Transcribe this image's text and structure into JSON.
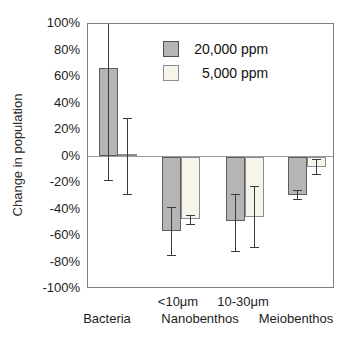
{
  "figure": {
    "background_color": "#ffffff",
    "frame_color": "#7f7f7f",
    "zero_line_color": "#9b9b9b",
    "error_bar_color": "#3a3a3a"
  },
  "legend": {
    "items": [
      {
        "label": "20,000 ppm",
        "number": "20,000",
        "unit": "ppm",
        "color": "#b5b5b5",
        "border_color": "#4f4f4f"
      },
      {
        "label": "5,000 ppm",
        "number": "5,000",
        "unit": "ppm",
        "color": "#f7f5ea",
        "border_color": "#8c8c8c"
      }
    ]
  },
  "chart_data": {
    "type": "bar",
    "title": "",
    "xlabel": "",
    "ylabel": "Change in population",
    "ylim": [
      -100,
      100
    ],
    "ytick_step": 20,
    "ytick_labels": [
      "100%",
      "80%",
      "60%",
      "40%",
      "20%",
      "0%",
      "-20%",
      "-40%",
      "-60%",
      "-80%",
      "-100%"
    ],
    "ytick_values": [
      100,
      80,
      60,
      40,
      20,
      0,
      -20,
      -40,
      -60,
      -80,
      -100
    ],
    "grid": "zero-line-only",
    "legend_position": "inside-top-center",
    "categories": [
      "Bacteria",
      "Nanobenthos <10μm",
      "Nanobenthos 10-30μm",
      "Meiobenthos"
    ],
    "category_axis_labels": {
      "row1": [
        "<10μm",
        "10-30μm"
      ],
      "row2": [
        "Bacteria",
        "Nanobenthos",
        "Meiobenthos"
      ]
    },
    "series": [
      {
        "name": "20,000 ppm",
        "color": "#b5b5b5",
        "values": [
          67,
          -56,
          -49,
          -29
        ],
        "error_low": [
          -18,
          -74,
          -71,
          -32
        ],
        "error_high": [
          108,
          -38,
          -28,
          -25
        ],
        "error_high_clipped_at_axis_top": [
          true,
          false,
          false,
          false
        ]
      },
      {
        "name": "5,000 ppm",
        "color": "#f7f5ea",
        "values": [
          2,
          -47,
          -46,
          -8
        ],
        "error_low": [
          -28,
          -51,
          -68,
          -13
        ],
        "error_high": [
          29,
          -44,
          -22,
          -2
        ],
        "error_high_clipped_at_axis_top": [
          false,
          false,
          false,
          false
        ]
      }
    ]
  }
}
